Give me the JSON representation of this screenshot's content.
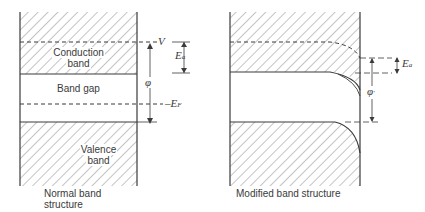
{
  "figure": {
    "left_panel": {
      "caption_line1": "Normal band",
      "caption_line2": "structure",
      "conduction_label_1": "Conduction",
      "conduction_label_2": "band",
      "gap_label": "Band gap",
      "valence_label_1": "Valence",
      "valence_label_2": "band",
      "vacuum_level_label": "V",
      "fermi_label": "E",
      "fermi_sub": "F",
      "ea_label": "E",
      "ea_sub": "a",
      "work_function_label": "φ"
    },
    "right_panel": {
      "caption": "Modified band structure",
      "ea_label": "E",
      "ea_sub": "a",
      "work_function_label": "φ",
      "work_function_prime": "'"
    },
    "colors": {
      "line": "#3a3a3a",
      "hatch": "#8a8a8a",
      "background": "#ffffff"
    }
  }
}
